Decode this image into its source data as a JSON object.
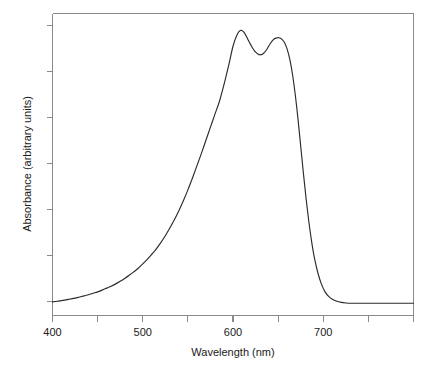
{
  "chart_data": {
    "type": "line",
    "title": "",
    "subtitle": "",
    "xlabel": "Wavelength (nm)",
    "ylabel": "Absorbance (arbitrary units)",
    "xlim": [
      400,
      800
    ],
    "ylim": [
      0,
      1.06
    ],
    "grid": false,
    "legend": null,
    "x_major_ticks": [
      400,
      500,
      600,
      700
    ],
    "x_major_tick_labels": [
      "400",
      "500",
      "600",
      "700"
    ],
    "x_minor_ticks": [
      450,
      550,
      650,
      750
    ],
    "y_ticks": [
      0.0,
      0.17,
      0.34,
      0.51,
      0.68,
      0.85,
      1.0
    ],
    "y_tick_labels": [
      "",
      "",
      "",
      "",
      "",
      "",
      ""
    ],
    "annotations": [
      {
        "label": "peak-1",
        "x": 608,
        "y": 1.0
      },
      {
        "label": "valley",
        "x": 630,
        "y": 0.915
      },
      {
        "label": "peak-2",
        "x": 651,
        "y": 0.975
      },
      {
        "label": "baseline-left",
        "x": 400,
        "y": 0.048
      },
      {
        "label": "baseline-right",
        "x": 730,
        "y": 0.043
      }
    ],
    "series": [
      {
        "name": "absorbance",
        "color": "#2b2b2b",
        "x": [
          400,
          405,
          410,
          415,
          420,
          425,
          430,
          435,
          440,
          445,
          450,
          455,
          460,
          465,
          470,
          475,
          480,
          485,
          490,
          495,
          500,
          505,
          510,
          515,
          520,
          525,
          530,
          535,
          540,
          545,
          550,
          555,
          560,
          565,
          570,
          575,
          580,
          585,
          590,
          595,
          600,
          604,
          608,
          612,
          616,
          620,
          624,
          628,
          630,
          633,
          637,
          641,
          645,
          648,
          651,
          654,
          657,
          660,
          663,
          666,
          669,
          672,
          675,
          678,
          681,
          684,
          687,
          690,
          694,
          698,
          702,
          706,
          710,
          715,
          720,
          725,
          730,
          740,
          750,
          760,
          770,
          780,
          790,
          800
        ],
        "y": [
          0.048,
          0.05,
          0.052,
          0.055,
          0.058,
          0.061,
          0.065,
          0.069,
          0.073,
          0.078,
          0.083,
          0.089,
          0.096,
          0.103,
          0.111,
          0.12,
          0.13,
          0.141,
          0.153,
          0.166,
          0.181,
          0.197,
          0.215,
          0.234,
          0.256,
          0.28,
          0.307,
          0.336,
          0.368,
          0.403,
          0.441,
          0.482,
          0.525,
          0.569,
          0.615,
          0.661,
          0.707,
          0.752,
          0.81,
          0.875,
          0.945,
          0.982,
          1.0,
          0.995,
          0.972,
          0.948,
          0.928,
          0.917,
          0.915,
          0.918,
          0.932,
          0.953,
          0.969,
          0.974,
          0.975,
          0.97,
          0.958,
          0.935,
          0.898,
          0.845,
          0.775,
          0.69,
          0.595,
          0.5,
          0.41,
          0.33,
          0.262,
          0.206,
          0.15,
          0.11,
          0.083,
          0.067,
          0.057,
          0.05,
          0.046,
          0.044,
          0.043,
          0.043,
          0.043,
          0.043,
          0.043,
          0.043,
          0.043,
          0.043
        ]
      }
    ]
  },
  "axes": {
    "x_title": "Wavelength (nm)",
    "y_title": "Absorbance (arbitrary units)",
    "x_tick_labels": [
      "400",
      "500",
      "600",
      "700"
    ]
  },
  "colors": {
    "background": "#ffffff",
    "frame": "#8a8a8a",
    "curve": "#2b2b2b",
    "text": "#1a1a1a"
  }
}
